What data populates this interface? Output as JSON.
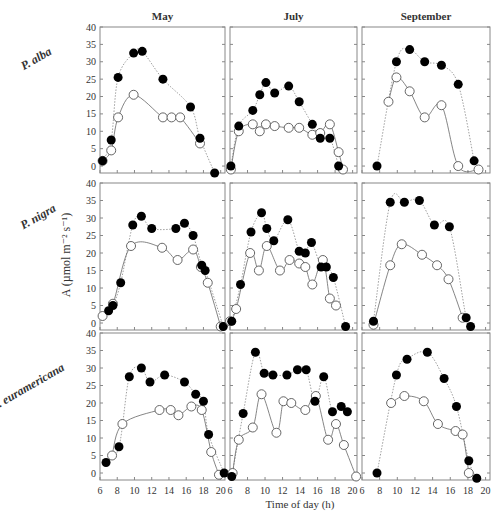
{
  "figure": {
    "ylabel": "A (µmol m⁻² s⁻¹)",
    "xlabel": "Time of day (h)",
    "columns": [
      "May",
      "July",
      "September"
    ],
    "rows": [
      "P. alba",
      "P. nigra",
      "P. euramericana"
    ],
    "yticks": [
      0,
      5,
      10,
      15,
      20,
      25,
      30,
      35,
      40
    ],
    "xticks": [
      6,
      8,
      10,
      12,
      14,
      16,
      18,
      20
    ],
    "colors": {
      "filled": "#000000",
      "open_stroke": "#555555",
      "line": "#666666"
    }
  },
  "chart_data": {
    "type": "scatter",
    "title": "",
    "xlabel": "Time of day (h)",
    "ylabel": "A (µmol m-2 s-1)",
    "xlim": [
      6,
      20.5
    ],
    "ylim": [
      -2,
      40
    ],
    "legend": [
      "filled circles (dotted line)",
      "open circles (solid line)"
    ],
    "panels": [
      {
        "row": "P. alba",
        "col": "May",
        "filled": {
          "x": [
            6.3,
            7.3,
            8.1,
            9.9,
            10.9,
            13.3,
            16.5,
            17.6,
            19.3
          ],
          "y": [
            1.5,
            7.5,
            25.5,
            32.5,
            33,
            25,
            17,
            8,
            -2
          ]
        },
        "open": {
          "x": [
            6.3,
            7.3,
            8.1,
            9.9,
            13.3,
            14.3,
            15.3,
            17.6
          ],
          "y": [
            1.5,
            4.5,
            14,
            20.5,
            14,
            14,
            14,
            6.5
          ]
        }
      },
      {
        "row": "P. alba",
        "col": "July",
        "filled": {
          "x": [
            6.1,
            7.0,
            8.6,
            9.4,
            10.1,
            11.1,
            12.7,
            13.9,
            15.4,
            16.3,
            17.4,
            18.4
          ],
          "y": [
            0,
            11.5,
            16,
            20.5,
            24,
            21,
            23,
            18.5,
            12,
            8,
            8,
            0
          ]
        },
        "open": {
          "x": [
            6.1,
            7.0,
            8.6,
            9.4,
            10.1,
            11.1,
            12.7,
            13.9,
            15.4,
            16.3,
            17.4,
            18.4,
            18.9
          ],
          "y": [
            -1,
            10,
            12,
            10,
            12,
            11.5,
            11,
            11,
            9,
            9.5,
            12,
            4,
            -1
          ]
        },
        "note": "approximate"
      },
      {
        "row": "P. alba",
        "col": "September",
        "filled": {
          "x": [
            7.7,
            9.9,
            11.4,
            13.1,
            15.0,
            16.9,
            18.7
          ],
          "y": [
            0,
            30,
            33.5,
            30,
            29,
            23.5,
            1.5
          ]
        },
        "open": {
          "x": [
            9.0,
            9.9,
            11.4,
            13.1,
            15.0,
            16.9,
            19.2
          ],
          "y": [
            18.5,
            25.5,
            21.5,
            14,
            17.5,
            0,
            -1
          ]
        }
      },
      {
        "row": "P. nigra",
        "col": "May",
        "filled": {
          "x": [
            7.0,
            7.5,
            8.4,
            9.8,
            10.8,
            12.0,
            14.8,
            15.8,
            16.8,
            17.8,
            18.2,
            20.3
          ],
          "y": [
            3.5,
            5,
            11.5,
            28,
            30.5,
            27,
            27,
            28.5,
            25,
            16.5,
            15,
            -1
          ]
        },
        "open": {
          "x": [
            6.3,
            7.5,
            9.6,
            13.2,
            15.0,
            16.8,
            17.7,
            18.5,
            20.0
          ],
          "y": [
            2,
            5.5,
            22,
            21.5,
            18,
            21,
            16,
            11.5,
            -1
          ]
        }
      },
      {
        "row": "P. nigra",
        "col": "July",
        "filled": {
          "x": [
            6.2,
            7.2,
            8.4,
            9.6,
            10.2,
            11.0,
            12.6,
            13.9,
            14.6,
            15.3,
            16.4,
            17.0,
            17.8,
            19.2
          ],
          "y": [
            0.5,
            11,
            26,
            31.5,
            27,
            23.5,
            29.5,
            20.5,
            20,
            23,
            16,
            16,
            13,
            -1
          ]
        },
        "open": {
          "x": [
            6.0,
            6.7,
            8.3,
            9.3,
            10.2,
            11.7,
            12.8,
            13.9,
            14.6,
            15.4,
            16.6,
            17.4,
            18.1
          ],
          "y": [
            0.5,
            4,
            20,
            15,
            22,
            15,
            18,
            17,
            16,
            11,
            18,
            7,
            5
          ]
        },
        "note": "approximate"
      },
      {
        "row": "P. nigra",
        "col": "September",
        "filled": {
          "x": [
            7.3,
            9.2,
            10.8,
            12.5,
            14.2,
            15.9,
            17.8,
            18.3
          ],
          "y": [
            0.5,
            34.5,
            34.5,
            35,
            28,
            27.5,
            1.5,
            -1
          ]
        },
        "open": {
          "x": [
            7.3,
            9.2,
            10.5,
            12.8,
            14.5,
            15.8,
            17.4
          ],
          "y": [
            -0.5,
            16.5,
            22.5,
            19.5,
            16.5,
            12.5,
            1.5
          ]
        }
      },
      {
        "row": "P. euramericana",
        "col": "May",
        "filled": {
          "x": [
            6.7,
            8.2,
            9.4,
            10.8,
            11.8,
            13.5,
            15.8,
            17.1,
            18.0,
            18.6,
            20.4
          ],
          "y": [
            3,
            7.5,
            27.5,
            30,
            26,
            28,
            26,
            22.5,
            20.5,
            11,
            0
          ]
        },
        "open": {
          "x": [
            7.4,
            8.6,
            12.9,
            14.2,
            15.1,
            16.6,
            17.8,
            18.9,
            19.8
          ],
          "y": [
            5,
            14,
            18,
            18,
            16.5,
            19,
            18,
            6,
            -0.5
          ]
        }
      },
      {
        "row": "P. euramericana",
        "col": "July",
        "filled": {
          "x": [
            6.2,
            7.5,
            8.9,
            9.9,
            10.9,
            12.5,
            13.7,
            14.7,
            15.7,
            16.7,
            17.7,
            18.7,
            19.4
          ],
          "y": [
            -1,
            17,
            34.5,
            28.5,
            28,
            28,
            29.5,
            29.5,
            20.5,
            27.5,
            17.5,
            19,
            17.5
          ]
        },
        "open": {
          "x": [
            6.3,
            7.0,
            8.6,
            9.6,
            11.3,
            12.1,
            13.0,
            14.6,
            15.8,
            17.2,
            18.1,
            19.0,
            20.4
          ],
          "y": [
            0,
            9.5,
            13,
            22.5,
            11.5,
            20.5,
            20,
            18,
            22,
            9.5,
            14,
            8,
            -1
          ]
        },
        "note": "approximate"
      },
      {
        "row": "P. euramericana",
        "col": "September",
        "filled": {
          "x": [
            7.7,
            9.9,
            11.1,
            13.4,
            15.3,
            16.7,
            18.1,
            19.0
          ],
          "y": [
            0,
            28,
            32.5,
            34.5,
            27,
            19,
            3.5,
            -1.5
          ]
        },
        "open": {
          "x": [
            9.3,
            10.8,
            13.0,
            14.6,
            16.6,
            17.4,
            18.1
          ],
          "y": [
            20,
            22,
            20.5,
            14,
            12,
            11,
            0
          ]
        }
      }
    ]
  }
}
